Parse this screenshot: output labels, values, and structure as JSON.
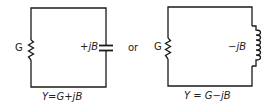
{
  "left_circuit": {
    "conductance_label": "G",
    "susceptance_label": "+jB",
    "equation": "Y=G+jB",
    "element": "capacitor"
  },
  "connector_text": "or",
  "right_circuit": {
    "conductance_label": "G",
    "susceptance_label": "−jB",
    "equation": "Y = G−jB",
    "element": "inductor"
  },
  "colors": {
    "line": "#1a1a1a",
    "text": "#222222",
    "background": "#ffffff"
  }
}
